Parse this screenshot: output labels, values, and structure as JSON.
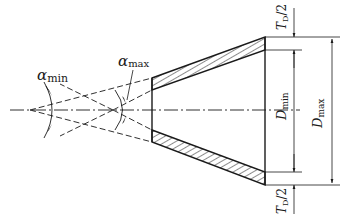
{
  "diagram": {
    "type": "cone-taper-tolerance-drawing",
    "labels": {
      "alpha_min": {
        "symbol": "α",
        "sub": "min"
      },
      "alpha_max": {
        "symbol": "α",
        "sub": "max"
      },
      "d_min": {
        "symbol": "D",
        "sub": "min"
      },
      "d_max": {
        "symbol": "D",
        "sub": "max"
      },
      "td_top": {
        "symbol": "T",
        "sub": "D",
        "suffix": "/2"
      },
      "td_bottom": {
        "symbol": "T",
        "sub": "D",
        "suffix": "/2"
      }
    },
    "colors": {
      "line": "#1a1a1a",
      "background": "#ffffff"
    }
  }
}
